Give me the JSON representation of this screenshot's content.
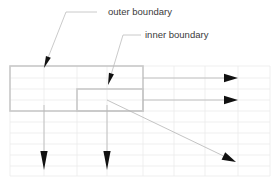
{
  "figure": {
    "title": "",
    "background_color": "#ffffff",
    "width": 278,
    "height": 184
  },
  "colors": {
    "mesh_line": "#e8e8e8",
    "boundary_line": "#c9c9c9",
    "arrow_stroke": "#b5b5b5",
    "arrow_head": "#111111",
    "leader_line": "#bdbdbd",
    "label_text": "#3a3a3a"
  },
  "labels": [
    {
      "id": "outer-boundary",
      "text": "outer boundary",
      "x": 108,
      "y": 12,
      "leader": {
        "horizontal_from_x": 97,
        "horizontal_to_x": 66,
        "horizontal_y": 12,
        "tip_x": 44,
        "tip_y": 68
      }
    },
    {
      "id": "inner-boundary",
      "text": "inner boundary",
      "x": 145,
      "y": 35,
      "leader": {
        "horizontal_from_x": 141,
        "horizontal_to_x": 123,
        "horizontal_y": 35,
        "tip_x": 108,
        "tip_y": 85
      }
    }
  ],
  "mesh": {
    "x_gridlines": [
      10,
      77,
      143,
      205,
      270
    ],
    "y_gridlines": [
      66,
      89,
      111,
      133,
      155,
      176
    ],
    "minor_x_gridlines": [
      44,
      107,
      174,
      238
    ],
    "minor_y_gridlines": [
      78,
      100,
      122,
      144,
      166
    ]
  },
  "boundaries": [
    {
      "id": "outer-boundary-region",
      "x": 10,
      "y": 66,
      "width": 133,
      "height": 45
    },
    {
      "id": "inner-boundary-region",
      "x": 77,
      "y": 89,
      "width": 66,
      "height": 22
    }
  ],
  "flow_arrows": [
    {
      "id": "outflow-arrow-upper",
      "x1": 143,
      "y1": 78,
      "x2": 238,
      "y2": 78,
      "direction": "right"
    },
    {
      "id": "outflow-arrow-lower",
      "x1": 143,
      "y1": 100,
      "x2": 238,
      "y2": 100,
      "direction": "right"
    },
    {
      "id": "downflow-arrow-left",
      "x1": 44,
      "y1": 105,
      "x2": 44,
      "y2": 170,
      "direction": "down"
    },
    {
      "id": "downflow-arrow-middle",
      "x1": 107,
      "y1": 105,
      "x2": 107,
      "y2": 170,
      "direction": "down"
    },
    {
      "id": "diagonal-arrow",
      "x1": 107,
      "y1": 100,
      "x2": 236,
      "y2": 162,
      "direction": "down-right"
    }
  ]
}
